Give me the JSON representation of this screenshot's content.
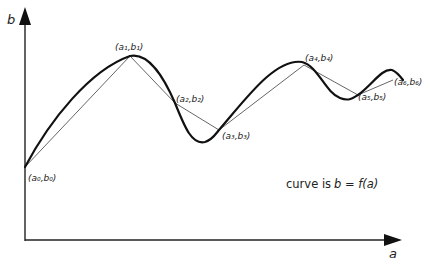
{
  "diagram": {
    "axes": {
      "y_label": "b",
      "x_label": "a"
    },
    "points": [
      {
        "id": "p0",
        "label": "(a₀,b₀)"
      },
      {
        "id": "p1",
        "label": "(a₁,b₁)"
      },
      {
        "id": "p2",
        "label": "(a₂,b₂)"
      },
      {
        "id": "p3",
        "label": "(a₃,b₃)"
      },
      {
        "id": "p4",
        "label": "(a₄,b₄)"
      },
      {
        "id": "p5",
        "label": "(a₅,b₅)"
      },
      {
        "id": "p6",
        "label": "(a₆,b₆)"
      }
    ],
    "caption": {
      "prefix": "curve is",
      "equation": "b = f(a)"
    },
    "colors": {
      "ink": "#1a1a1a",
      "chord": "#555555"
    }
  }
}
